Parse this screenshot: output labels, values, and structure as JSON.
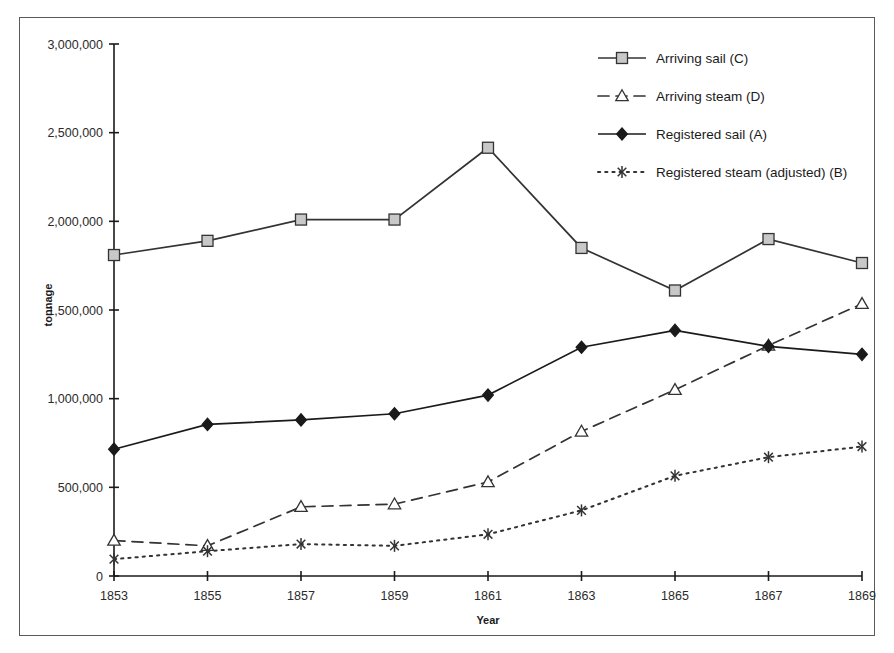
{
  "chart_data": {
    "type": "line",
    "title": "",
    "xlabel": "Year",
    "ylabel": "tonnage",
    "categories": [
      1853,
      1855,
      1857,
      1859,
      1861,
      1863,
      1865,
      1867,
      1869
    ],
    "x": [
      1853,
      1855,
      1857,
      1859,
      1861,
      1863,
      1865,
      1867,
      1869
    ],
    "xtick_labels": [
      "1853",
      "1855",
      "1857",
      "1859",
      "1861",
      "1863",
      "1865",
      "1867",
      "1869"
    ],
    "ytick_labels": [
      "0",
      "500,000",
      "1,000,000",
      "1,500,000",
      "2,000,000",
      "2,500,000",
      "3,000,000"
    ],
    "ytick_values": [
      0,
      500000,
      1000000,
      1500000,
      2000000,
      2500000,
      3000000
    ],
    "xlim": [
      1853,
      1869
    ],
    "ylim": [
      0,
      3000000
    ],
    "grid": false,
    "legend_position": "top-right",
    "series": [
      {
        "name": "Arriving sail (C)",
        "key": "C",
        "marker": "square",
        "line_style": "solid",
        "color": "#333333",
        "marker_fill": "#c8c8c8",
        "values": [
          1810000,
          1890000,
          2010000,
          2010000,
          2415000,
          1850000,
          1610000,
          1900000,
          1765000
        ]
      },
      {
        "name": "Arriving steam (D)",
        "key": "D",
        "marker": "triangle",
        "line_style": "dashed",
        "color": "#333333",
        "marker_fill": "#ffffff",
        "values": [
          200000,
          170000,
          390000,
          405000,
          530000,
          815000,
          1050000,
          1300000,
          1535000
        ]
      },
      {
        "name": "Registered sail (A)",
        "key": "A",
        "marker": "diamond",
        "line_style": "solid",
        "color": "#1a1a1a",
        "marker_fill": "#1a1a1a",
        "values": [
          715000,
          855000,
          880000,
          915000,
          1020000,
          1290000,
          1385000,
          1295000,
          1250000
        ]
      },
      {
        "name": "Registered steam (adjusted) (B)",
        "key": "B",
        "marker": "asterisk",
        "line_style": "dotted",
        "color": "#333333",
        "marker_fill": "#333333",
        "values": [
          95000,
          140000,
          180000,
          170000,
          235000,
          370000,
          565000,
          670000,
          730000
        ]
      }
    ]
  },
  "legend": {
    "items": [
      {
        "label": "Arriving sail (C)"
      },
      {
        "label": "Arriving steam (D)"
      },
      {
        "label": "Registered sail (A)"
      },
      {
        "label": "Registered steam (adjusted) (B)"
      }
    ]
  },
  "axes": {
    "x_title": "Year",
    "y_title": "tonnage"
  }
}
